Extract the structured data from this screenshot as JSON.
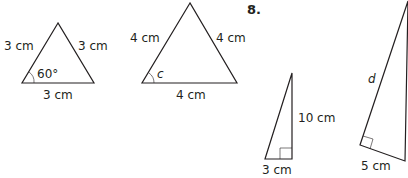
{
  "problem_number": "8.",
  "triangles": [
    {
      "name": "equilateral-triangle-3cm",
      "sides": [
        "3 cm",
        "3 cm",
        "3 cm"
      ],
      "angle_label": "60°"
    },
    {
      "name": "equilateral-triangle-4cm",
      "sides": [
        "4 cm",
        "4 cm",
        "4 cm"
      ],
      "angle_label": "c"
    },
    {
      "name": "right-triangle-small",
      "leg_vertical": "10 cm",
      "leg_horizontal": "3 cm"
    },
    {
      "name": "right-triangle-large",
      "hypotenuse_label": "d",
      "leg_short": "5 cm"
    }
  ],
  "colors": {
    "stroke": "#231f20",
    "background": "#ffffff"
  }
}
